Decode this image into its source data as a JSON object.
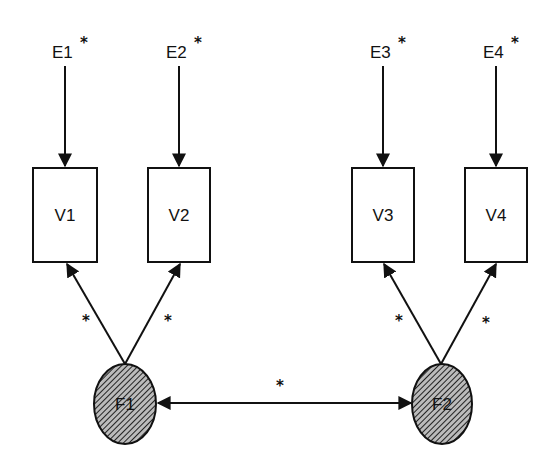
{
  "diagram": {
    "type": "path diagram (confirmatory factor model)",
    "errors": [
      {
        "id": "E1",
        "label": "E1",
        "star": "*"
      },
      {
        "id": "E2",
        "label": "E2",
        "star": "*"
      },
      {
        "id": "E3",
        "label": "E3",
        "star": "*"
      },
      {
        "id": "E4",
        "label": "E4",
        "star": "*"
      }
    ],
    "variables": [
      {
        "id": "V1",
        "label": "V1"
      },
      {
        "id": "V2",
        "label": "V2"
      },
      {
        "id": "V3",
        "label": "V3"
      },
      {
        "id": "V4",
        "label": "V4"
      }
    ],
    "factors": [
      {
        "id": "F1",
        "label": "F1"
      },
      {
        "id": "F2",
        "label": "F2"
      }
    ],
    "loadings": [
      {
        "from": "F1",
        "to": "V1",
        "label": "*"
      },
      {
        "from": "F1",
        "to": "V2",
        "label": "*"
      },
      {
        "from": "F2",
        "to": "V3",
        "label": "*"
      },
      {
        "from": "F2",
        "to": "V4",
        "label": "*"
      }
    ],
    "covariance": {
      "between": [
        "F1",
        "F2"
      ],
      "label": "*"
    },
    "colors": {
      "stroke": "#111111",
      "factor_fill": "#777777",
      "background": "#ffffff"
    }
  }
}
